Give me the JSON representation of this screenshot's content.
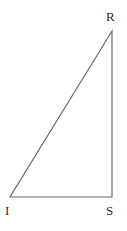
{
  "figure": {
    "kind": "geometry-diagram",
    "shape_name": "right-triangle",
    "background_color": "#ffffff",
    "stroke_color": "#6b6b6b",
    "label_color": "#2b2b2b",
    "stroke_width": 1.2,
    "canvas": {
      "width": 127,
      "height": 231
    }
  },
  "vertices": [
    {
      "id": "I",
      "label": "I",
      "x": 10,
      "y": 197,
      "label_x": 5,
      "label_y": 204,
      "angle": "right"
    },
    {
      "id": "S",
      "label": "S",
      "x": 112,
      "y": 197,
      "label_x": 106,
      "label_y": 204,
      "angle": "acute"
    },
    {
      "id": "R",
      "label": "R",
      "x": 112,
      "y": 31,
      "label_x": 106,
      "label_y": 10,
      "angle": "acute"
    }
  ],
  "edges": [
    {
      "id": "IS",
      "from": "I",
      "to": "S",
      "role": "base"
    },
    {
      "id": "SR",
      "from": "S",
      "to": "R",
      "role": "vertical-leg"
    },
    {
      "id": "RI",
      "from": "R",
      "to": "I",
      "role": "hypotenuse"
    }
  ],
  "polygon_points": "10,197 112,197 112,31"
}
